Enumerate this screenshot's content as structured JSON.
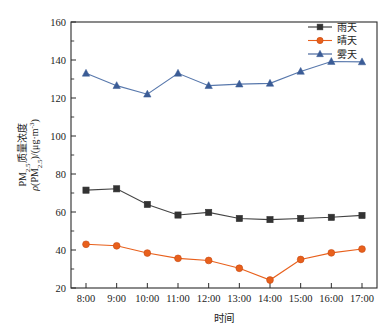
{
  "chart_data": {
    "type": "line",
    "title": "",
    "xlabel": "时间",
    "ylabel": "PM2.5质量浓度 ρ(PM2.5)/(μg·m⁻³)",
    "ylabel_line1": "PM",
    "ylabel_line1_sub": "2.5",
    "ylabel_line1_rest": "质量浓度",
    "ylabel_line2_rho": "ρ",
    "ylabel_line2_open": "(PM",
    "ylabel_line2_sub": "2.5",
    "ylabel_line2_close": ")/(μg·m",
    "ylabel_line2_sup": "-3",
    "ylabel_line2_end": ")",
    "categories": [
      "8:00",
      "9:00",
      "10:00",
      "11:00",
      "12:00",
      "13:00",
      "14:00",
      "15:00",
      "16:00",
      "17:00"
    ],
    "x": [
      "8:00",
      "9:00",
      "10:00",
      "11:00",
      "12:00",
      "13:00",
      "14:00",
      "15:00",
      "16:00",
      "17:00"
    ],
    "ylim": [
      20,
      160
    ],
    "yticks": [
      20,
      40,
      60,
      80,
      100,
      120,
      140,
      160
    ],
    "ytick_labels": [
      "20",
      "40",
      "60",
      "80",
      "100",
      "120",
      "140",
      "160"
    ],
    "y_minor_step": 10,
    "grid": false,
    "legend_position": "top-right",
    "series": [
      {
        "name": "雨天",
        "marker": "square",
        "color": "#333333",
        "line_color": "#444444",
        "values": [
          71.5,
          72.2,
          64.0,
          58.4,
          59.8,
          56.6,
          56.0,
          56.6,
          57.2,
          58.2
        ]
      },
      {
        "name": "晴天",
        "marker": "circle",
        "color": "#E8601C",
        "line_color": "#E8601C",
        "values": [
          43.0,
          42.2,
          38.4,
          35.6,
          34.5,
          30.4,
          24.2,
          35.0,
          38.5,
          40.5
        ]
      },
      {
        "name": "雾天",
        "marker": "triangle",
        "color": "#3B5C96",
        "line_color": "#5878AC",
        "values": [
          133.0,
          126.5,
          122.0,
          133.0,
          126.5,
          127.3,
          127.7,
          134.0,
          139.2,
          139.0
        ]
      }
    ]
  },
  "legend": {
    "items": [
      {
        "label": "雨天",
        "marker": "square",
        "color": "#333333"
      },
      {
        "label": "晴天",
        "marker": "circle",
        "color": "#E8601C"
      },
      {
        "label": "雾天",
        "marker": "triangle",
        "color": "#3B5C96"
      }
    ]
  },
  "axes": {
    "x_axis_title": "时间",
    "y_axis_unit": "μg·m⁻³"
  }
}
